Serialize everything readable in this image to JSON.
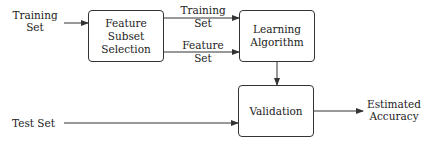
{
  "diagram": {
    "inputs": {
      "training_set": [
        "Training",
        "Set"
      ],
      "test_set": "Test Set"
    },
    "nodes": {
      "feature_subset_selection": [
        "Feature Subset",
        "Selection"
      ],
      "learning_algorithm": [
        "Learning",
        "Algorithm"
      ],
      "validation": "Validation"
    },
    "edge_labels": {
      "training_set": [
        "Training",
        "Set"
      ],
      "feature_set": [
        "Feature",
        "Set"
      ]
    },
    "output": [
      "Estimated",
      "Accuracy"
    ]
  }
}
